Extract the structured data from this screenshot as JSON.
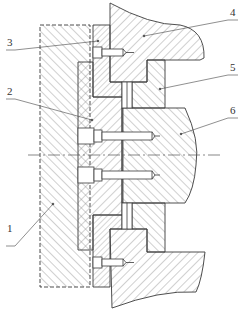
{
  "diagram": {
    "type": "mechanical cross-section",
    "colors": {
      "line": "#3a3a3a",
      "hatch": "#8a8a8a",
      "background": "#ffffff"
    },
    "labels": [
      {
        "id": "1",
        "text": "1",
        "x": 6,
        "y": 236
      },
      {
        "id": "2",
        "text": "2",
        "x": 6,
        "y": 88
      },
      {
        "id": "3",
        "text": "3",
        "x": 6,
        "y": 40
      },
      {
        "id": "4",
        "text": "4",
        "x": 231,
        "y": 9
      },
      {
        "id": "5",
        "text": "5",
        "x": 231,
        "y": 64
      },
      {
        "id": "6",
        "text": "6",
        "x": 231,
        "y": 107
      }
    ],
    "centerline": {
      "y": 155
    }
  }
}
